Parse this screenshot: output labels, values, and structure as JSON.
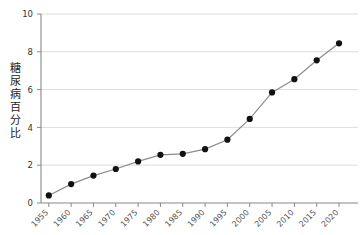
{
  "chart_data": {
    "type": "line",
    "title": "",
    "subtitle": "",
    "xlabel": "",
    "ylabel": "糖尿病百分比",
    "categories": [
      "1955",
      "1960",
      "1965",
      "1970",
      "1975",
      "1980",
      "1985",
      "1990",
      "1995",
      "2000",
      "2005",
      "2010",
      "2015",
      "2020"
    ],
    "values": [
      0.4,
      1.0,
      1.45,
      1.8,
      2.2,
      2.55,
      2.6,
      2.85,
      3.35,
      4.45,
      5.85,
      6.55,
      7.55,
      8.45
    ],
    "series": [
      {
        "name": "糖尿病百分比",
        "values": [
          0.4,
          1.0,
          1.45,
          1.8,
          2.2,
          2.55,
          2.6,
          2.85,
          3.35,
          4.45,
          5.85,
          6.55,
          7.55,
          8.45
        ]
      }
    ],
    "ylim": [
      0,
      10
    ],
    "yticks": [
      "0",
      "2",
      "4",
      "6",
      "8",
      "10"
    ],
    "ytick_values": [
      0,
      2,
      4,
      6,
      8,
      10
    ],
    "grid": "horizontal",
    "legend": "none",
    "marker": "filled-circle",
    "line_color": "#8c8c8c",
    "marker_color": "#111111",
    "grid_color": "#d9d9d9",
    "axis_color": "#888888",
    "background_color": "#ffffff"
  },
  "axis": {
    "y_label_chars": [
      "糖",
      "尿",
      "病",
      "百",
      "分",
      "比"
    ]
  }
}
